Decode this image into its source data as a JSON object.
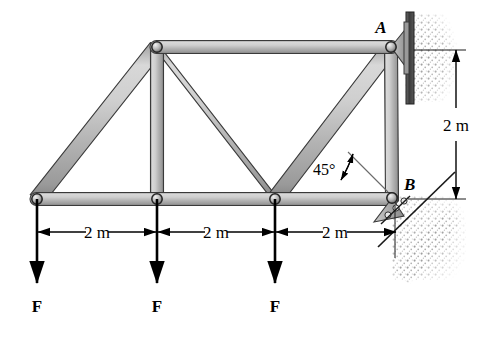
{
  "figure": {
    "kind": "statics-truss-free-body-diagram",
    "background_color": "#ffffff",
    "member_fill_light": "#e8e8e8",
    "member_fill_mid": "#b9b9b9",
    "member_fill_dark": "#8d8d8d",
    "member_stroke": "#2b2b2b",
    "wall_color": "#4a4a4a",
    "hatch_color": "#b0b0b0",
    "line_color": "#000000"
  },
  "labels": {
    "support_a": "A",
    "support_b": "B",
    "angle": "45°",
    "force_1": "F",
    "force_2": "F",
    "force_3": "F",
    "span_1": "2 m",
    "span_2": "2 m",
    "span_3": "2 m",
    "height": "2 m"
  },
  "icons": {
    "pin_joint": "pin-joint-circle",
    "pin_support": "pin-support-bracket",
    "roller_support": "roller-support-rollers",
    "wall": "fixed-wall-plate",
    "ground_hatch": "ground-hatching",
    "force_arrow": "downward-force-arrow",
    "dim_arrow": "dimension-double-arrow",
    "angle_leader": "angle-leader-double-arrow"
  },
  "geometry": {
    "joints": [
      {
        "name": "bottom-left",
        "x": 37,
        "y": 199
      },
      {
        "name": "bottom-mid-1",
        "x": 157,
        "y": 199
      },
      {
        "name": "bottom-mid-2",
        "x": 275,
        "y": 199
      },
      {
        "name": "bottom-right-b",
        "x": 392,
        "y": 198
      },
      {
        "name": "top-left",
        "x": 157,
        "y": 47
      },
      {
        "name": "top-right-a",
        "x": 391,
        "y": 47
      }
    ],
    "members": [
      {
        "name": "bottom-chord",
        "from": "bottom-left",
        "to": "bottom-right-b"
      },
      {
        "name": "top-chord",
        "from": "top-left",
        "to": "top-right-a"
      },
      {
        "name": "left-diagonal",
        "from": "bottom-left",
        "to": "top-left"
      },
      {
        "name": "left-vertical",
        "from": "top-left",
        "to": "bottom-mid-1"
      },
      {
        "name": "center-diagonal",
        "from": "top-left",
        "to": "bottom-mid-2"
      },
      {
        "name": "right-diagonal",
        "from": "bottom-mid-2",
        "to": "top-right-a"
      },
      {
        "name": "right-vertical",
        "from": "top-right-a",
        "to": "bottom-right-b"
      }
    ],
    "loads": [
      {
        "name": "load-1",
        "x": 37,
        "label": "F"
      },
      {
        "name": "load-2",
        "x": 157,
        "label": "F"
      },
      {
        "name": "load-3",
        "x": 275,
        "label": "F"
      }
    ],
    "dimensions": {
      "horizontal_y": 232,
      "spans": [
        {
          "name": "span-1",
          "x1": 37,
          "x2": 157,
          "label": "2 m"
        },
        {
          "name": "span-2",
          "x1": 157,
          "x2": 275,
          "label": "2 m"
        },
        {
          "name": "span-3",
          "x1": 275,
          "x2": 395,
          "label": "2 m"
        }
      ],
      "vertical": {
        "name": "height-dim",
        "x": 456,
        "y1": 50,
        "y2": 199,
        "label": "2 m"
      }
    },
    "angle_marker": {
      "name": "angle-45",
      "vertex_x": 392,
      "vertex_y": 199,
      "label": "45°"
    }
  }
}
